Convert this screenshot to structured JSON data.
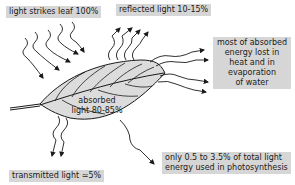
{
  "diagram": {
    "labels": {
      "strikes": "light strikes leaf 100%",
      "reflected": "reflected light 10-15%",
      "heat_line1": "most of absorbed",
      "heat_line2": "energy lost in",
      "heat_line3": "heat and in",
      "heat_line4": "evaporation",
      "heat_line5": "of water",
      "absorbed_line1": "absorbed",
      "absorbed_line2": "light 80-85%",
      "transmitted": "transmitted light ≃5%",
      "photo_line1": "only 0.5 to 3.5% of total light",
      "photo_line2": "energy used in photosynthesis"
    },
    "colors": {
      "label_bg": "#d6d6d6",
      "leaf_fill": "#dcdcdc",
      "line": "#1a1a1a"
    }
  }
}
